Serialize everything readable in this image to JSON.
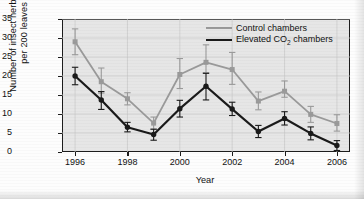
{
  "chart_data": {
    "type": "line",
    "title": "",
    "xlabel": "Year",
    "ylabel": "Number of insect herbivores per 200 leaves",
    "x": [
      1996,
      1997,
      1998,
      1999,
      2000,
      2001,
      2002,
      2003,
      2004,
      2005,
      2006
    ],
    "xlim": [
      1995.5,
      2006.5
    ],
    "ylim": [
      0,
      35
    ],
    "yticks": [
      0,
      5,
      10,
      15,
      20,
      25,
      30,
      35
    ],
    "xticks": [
      1996,
      1998,
      2000,
      2002,
      2004,
      2006
    ],
    "grid": true,
    "legend_position": "top-right",
    "series": [
      {
        "name": "Control chambers",
        "color": "#9a9a9a",
        "marker": "square",
        "values": [
          29.0,
          18.5,
          14.0,
          7.6,
          20.4,
          23.6,
          21.7,
          13.4,
          16.0,
          9.9,
          7.5
        ],
        "err_low": [
          3.4,
          3.0,
          1.6,
          1.6,
          3.7,
          2.7,
          3.9,
          2.3,
          1.6,
          2.1,
          2.0
        ],
        "err_high": [
          3.4,
          3.6,
          1.6,
          1.6,
          4.2,
          4.6,
          4.5,
          2.4,
          2.7,
          2.1,
          2.3
        ]
      },
      {
        "name": "Elevated CO₂ chambers",
        "color": "#1a1a1a",
        "marker": "circle",
        "values": [
          20.0,
          13.7,
          6.5,
          4.6,
          11.4,
          17.3,
          11.3,
          5.4,
          8.8,
          4.9,
          1.7
        ],
        "err_low": [
          2.3,
          2.5,
          1.2,
          1.5,
          2.2,
          3.6,
          1.7,
          1.6,
          1.7,
          1.7,
          1.3
        ],
        "err_high": [
          2.3,
          2.2,
          1.3,
          1.4,
          2.2,
          3.4,
          1.8,
          1.6,
          1.8,
          1.7,
          1.3
        ]
      }
    ]
  },
  "legend": {
    "control_label": "Control chambers",
    "elevated_label_prefix": "Elevated CO",
    "elevated_label_sub": "2",
    "elevated_label_suffix": " chambers"
  },
  "axes": {
    "x_title": "Year",
    "y_title_line1": "Number of insect herbivores",
    "y_title_line2": "per 200 leaves"
  }
}
